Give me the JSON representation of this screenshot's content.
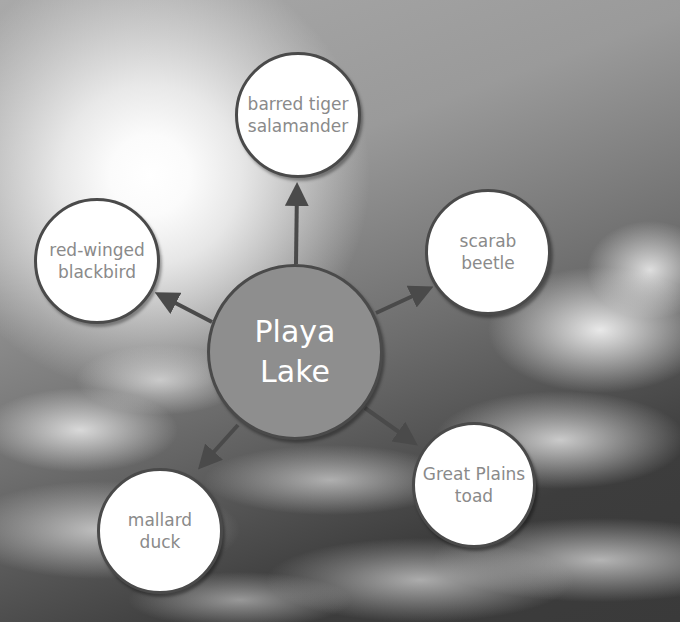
{
  "diagram": {
    "type": "web-diagram",
    "center": {
      "label": "Playa\nLake"
    },
    "nodes": [
      {
        "id": "top",
        "label": "barred tiger\nsalamander"
      },
      {
        "id": "left",
        "label": "red-winged\nblackbird"
      },
      {
        "id": "right",
        "label": "scarab\nbeetle"
      },
      {
        "id": "lower-right",
        "label": "Great Plains\ntoad"
      },
      {
        "id": "lower-left",
        "label": "mallard\nduck"
      }
    ],
    "edges": [
      {
        "from": "center",
        "to": "top"
      },
      {
        "from": "center",
        "to": "left"
      },
      {
        "from": "center",
        "to": "right"
      },
      {
        "from": "center",
        "to": "lower-right"
      },
      {
        "from": "center",
        "to": "lower-left"
      }
    ],
    "colors": {
      "center_fill": "#8e8e8e",
      "node_fill": "#ffffff",
      "outline": "#4a4a4a",
      "arrow": "#4a4a4a",
      "node_text": "#8a8a8a",
      "center_text": "#ffffff"
    }
  }
}
